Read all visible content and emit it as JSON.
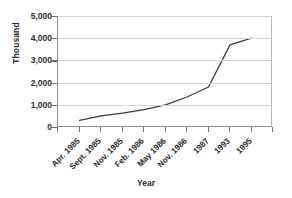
{
  "chart_data": {
    "type": "line",
    "title": "",
    "xlabel": "Year",
    "ylabel": "Thousand",
    "categories": [
      "Apr. 1985",
      "Sept. 1985",
      "Nov. 1985",
      "Feb. 1986",
      "May 1986",
      "Nov. 1986",
      "1987",
      "1993",
      "1995"
    ],
    "values": [
      300,
      500,
      620,
      780,
      1000,
      1350,
      1800,
      3700,
      4000
    ],
    "series": [
      {
        "name": "",
        "values": [
          300,
          500,
          620,
          780,
          1000,
          1350,
          1800,
          3700,
          4000
        ]
      }
    ],
    "ylim": [
      0,
      5000
    ],
    "ytick_labels": [
      "0",
      "1,000",
      "2,000",
      "3,000",
      "4,000",
      "5,000"
    ],
    "ytick_values": [
      0,
      1000,
      2000,
      3000,
      4000,
      5000
    ],
    "grid": true,
    "legend": false,
    "legend_position": "none",
    "line_color": "#3a3a3a",
    "grid_color": "#d2d2d2",
    "axis_color": "#8c8c8c",
    "background_color": "#ffffff",
    "xtick_rotation": -45
  }
}
